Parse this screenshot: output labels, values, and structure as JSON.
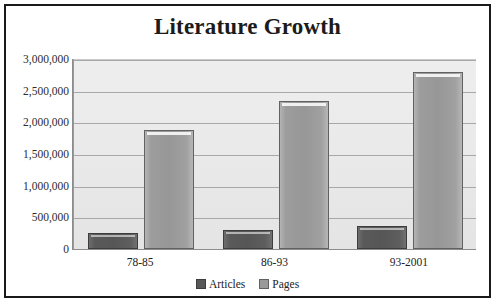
{
  "chart_data": {
    "type": "bar",
    "title": "Literature Growth",
    "xlabel": "",
    "ylabel": "",
    "categories": [
      "78-85",
      "86-93",
      "93-2001"
    ],
    "series": [
      {
        "name": "Articles",
        "color": "#585858",
        "values": [
          250000,
          300000,
          370000
        ]
      },
      {
        "name": "Pages",
        "color": "#9a9a9a",
        "values": [
          1880000,
          2340000,
          2790000
        ]
      }
    ],
    "ylim": [
      0,
      3000000
    ],
    "y_ticks": [
      0,
      500000,
      1000000,
      1500000,
      2000000,
      2500000,
      3000000
    ],
    "y_tick_labels": [
      "0",
      "500,000",
      "1,000,000",
      "1,500,000",
      "2,000,000",
      "2,500,000",
      "3,000,000"
    ],
    "grid": true,
    "legend_position": "bottom",
    "plot_background": "#e9e9e9",
    "frame_color": "#1a1a1a"
  }
}
